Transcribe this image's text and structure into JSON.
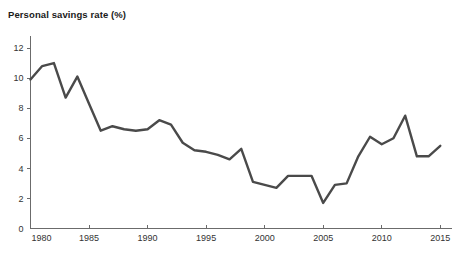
{
  "chart_data": {
    "type": "line",
    "title": "Personal savings rate (%)",
    "xlabel": "",
    "ylabel": "",
    "xlim": [
      1980,
      2016
    ],
    "ylim": [
      0,
      12
    ],
    "grid": false,
    "legend": "none",
    "line_color": "#4a4a4a",
    "axis_color": "#6b6b6b",
    "background_color": "#ffffff",
    "xticks": [
      1980,
      1985,
      1990,
      1995,
      2000,
      2005,
      2010,
      2015
    ],
    "yticks": [
      0,
      2,
      4,
      6,
      8,
      10,
      12
    ],
    "x": [
      1980,
      1981,
      1982,
      1983,
      1984,
      1985,
      1986,
      1987,
      1988,
      1989,
      1990,
      1991,
      1992,
      1993,
      1994,
      1995,
      1996,
      1997,
      1998,
      1999,
      2000,
      2001,
      2002,
      2003,
      2004,
      2005,
      2006,
      2007,
      2008,
      2009,
      2010,
      2011,
      2012,
      2013,
      2014,
      2015
    ],
    "values": [
      9.9,
      10.8,
      11.0,
      8.7,
      10.1,
      8.3,
      6.5,
      6.8,
      6.6,
      6.5,
      6.6,
      7.2,
      6.9,
      5.7,
      5.2,
      5.1,
      4.9,
      4.6,
      5.3,
      3.1,
      2.9,
      2.7,
      3.5,
      3.5,
      3.5,
      1.7,
      2.9,
      3.0,
      4.8,
      6.1,
      5.6,
      6.0,
      7.5,
      4.8,
      4.8,
      5.5
    ],
    "series_name": "Personal savings rate"
  }
}
